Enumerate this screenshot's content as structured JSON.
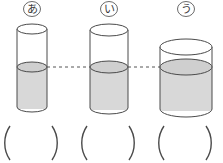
{
  "page": {
    "background_color": "#ffffff",
    "width": 223,
    "height": 163
  },
  "style": {
    "outline_color": "#4a4a4a",
    "water_fill": "#d8d8d8",
    "water_surface_fill": "#cfcfcf",
    "dashed_line_color": "#555555",
    "label_color": "#3a3a3a",
    "paren_color": "#4a4a4a"
  },
  "labels": [
    {
      "text": "あ",
      "circled": true,
      "name": "label-a"
    },
    {
      "text": "い",
      "circled": true,
      "name": "label-i"
    },
    {
      "text": "う",
      "circled": true,
      "name": "label-u"
    }
  ],
  "cylinders": [
    {
      "id": "a",
      "label": "あ",
      "cx": 32,
      "rx": 15,
      "ry": 5,
      "top_y": 29,
      "bottom_y": 107,
      "water_y": 67,
      "width_rank": "narrow",
      "height_rank": "tall",
      "water_level_equal": true
    },
    {
      "id": "i",
      "label": "い",
      "cx": 109,
      "rx": 19,
      "ry": 6,
      "top_y": 30,
      "bottom_y": 108,
      "water_y": 67,
      "width_rank": "medium",
      "height_rank": "tall",
      "water_level_equal": true
    },
    {
      "id": "u",
      "label": "う",
      "cx": 186,
      "rx": 26,
      "ry": 8,
      "top_y": 47,
      "bottom_y": 109,
      "water_y": 67,
      "width_rank": "wide",
      "height_rank": "short",
      "water_level_equal": true
    }
  ],
  "water_level_line": {
    "name": "water-level-dashed-line",
    "y": 67,
    "x_start": 47,
    "x_end": 212,
    "style": "dashed",
    "description": "Dashed guide line connecting the equal water surfaces"
  },
  "answer_blanks": [
    {
      "id": "blank-a",
      "value": "",
      "open": "(",
      "close": ")",
      "cx": 31
    },
    {
      "id": "blank-i",
      "value": "",
      "open": "(",
      "close": ")",
      "cx": 108
    },
    {
      "id": "blank-u",
      "value": "",
      "open": "(",
      "close": ")",
      "cx": 185
    }
  ]
}
